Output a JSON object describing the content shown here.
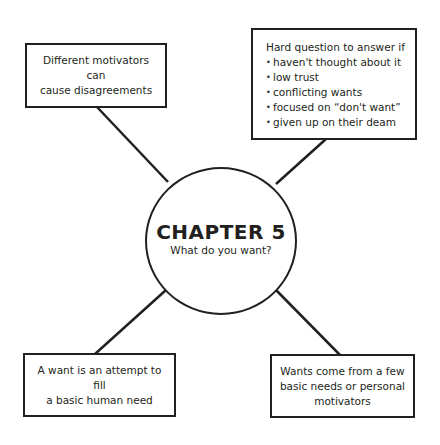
{
  "center": {
    "title": "CHAPTER 5",
    "subtitle": "What do you want?"
  },
  "boxes": {
    "top_left": {
      "lines": [
        "Different motivators can",
        "cause disagreements"
      ]
    },
    "top_right": {
      "heading": "Hard question to answer if",
      "bullets": [
        "haven't thought about it",
        "low trust",
        "conflicting wants",
        "focused on “don't want”",
        "given up on their deam"
      ]
    },
    "bottom_left": {
      "lines": [
        "A want is an attempt to fill",
        "a basic human need"
      ]
    },
    "bottom_right": {
      "lines": [
        "Wants come from a few",
        "basic needs or personal",
        "motivators"
      ]
    }
  },
  "colors": {
    "stroke": "#231f20",
    "background": "#ffffff"
  }
}
